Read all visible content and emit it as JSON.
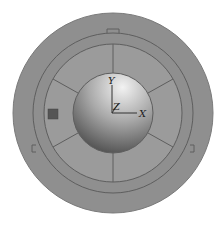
{
  "diagram": {
    "axes": {
      "x": "X",
      "y": "Y",
      "z": "Z"
    },
    "colors": {
      "outer_ring": "#8f8f8f",
      "ring_line": "#5a5a5a",
      "segment_fill": "#999999",
      "core_top": "#e8e8e8",
      "core_bottom": "#4a4a4a",
      "marker": "#555555"
    }
  },
  "caption": ""
}
